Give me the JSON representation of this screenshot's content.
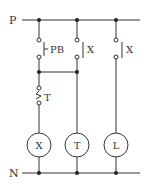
{
  "diagram": {
    "type": "relay ladder circuit",
    "rails": {
      "top": "P",
      "bottom": "N"
    },
    "contacts": {
      "push_button": "PB",
      "relay_contact_1": "X",
      "relay_contact_2": "X",
      "timer_contact": "T"
    },
    "loads": [
      "X",
      "T",
      "L"
    ],
    "colors": {
      "line": "#333333",
      "background": "#ffffff"
    }
  }
}
